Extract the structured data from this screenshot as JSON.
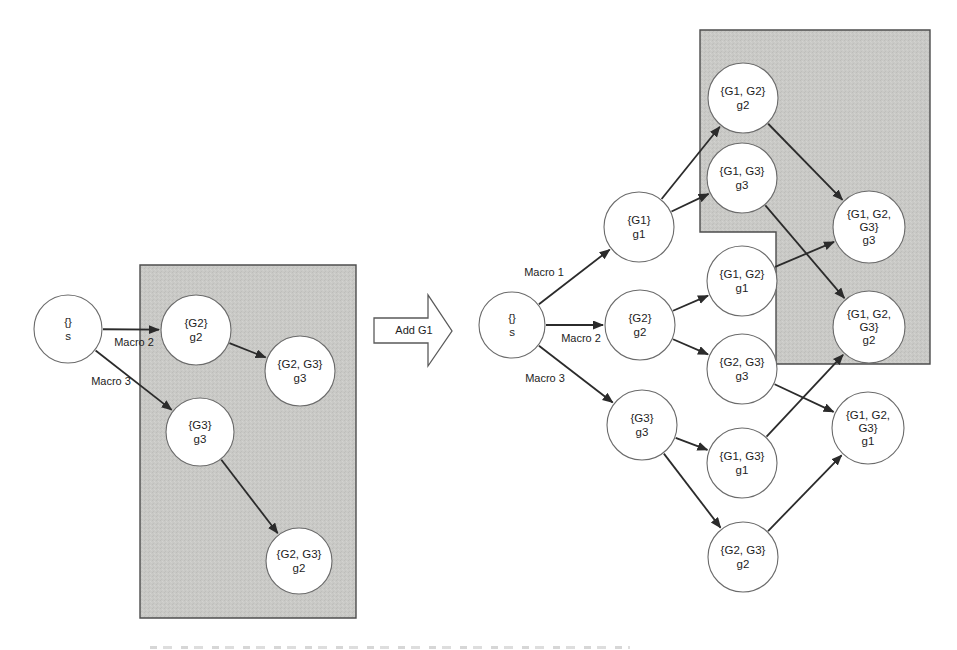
{
  "figure": {
    "background": "#ffffff",
    "region_fill": "#c9c9c6",
    "region_fill_dark_speck": "#bdbdba",
    "region_fill_light_speck": "#d3d3d0",
    "region_stroke": "#4d4d4d",
    "edge_color": "#2b2b2b",
    "node_fill": "#ffffff",
    "node_stroke": "#6b6b6b",
    "text_color": "#1d1d1d"
  },
  "transition_arrow": {
    "label": "Add G1",
    "points": "374,318 428,318 428,295 452,331 428,366 428,343 374,343",
    "label_x": 414,
    "label_y": 334
  },
  "left_graph": {
    "regions": [
      {
        "name": "macro-subset-region",
        "points": "140,265 356,265 356,618 140,618"
      }
    ],
    "nodes": [
      {
        "id": "s",
        "x": 68,
        "y": 329,
        "r": 34,
        "lines": [
          "{}",
          "s"
        ]
      },
      {
        "id": "g2",
        "x": 196,
        "y": 330,
        "r": 35,
        "lines": [
          "{G2}",
          "g2"
        ]
      },
      {
        "id": "g23-g3",
        "x": 300,
        "y": 371,
        "r": 35,
        "lines": [
          "{G2, G3}",
          "g3"
        ]
      },
      {
        "id": "g3",
        "x": 200,
        "y": 432,
        "r": 34,
        "lines": [
          "{G3}",
          "g3"
        ]
      },
      {
        "id": "g23-g2",
        "x": 299,
        "y": 561,
        "r": 33,
        "lines": [
          "{G2, G3}",
          "g2"
        ]
      }
    ],
    "edges": [
      {
        "from": "s",
        "to": "g2",
        "label": "Macro 2",
        "lx": 134,
        "ly": 346
      },
      {
        "from": "s",
        "to": "g3",
        "label": "Macro 3",
        "lx": 111,
        "ly": 385
      },
      {
        "from": "g2",
        "to": "g23-g3",
        "label": "",
        "lx": 0,
        "ly": 0
      },
      {
        "from": "g3",
        "to": "g23-g2",
        "label": "",
        "lx": 0,
        "ly": 0
      }
    ]
  },
  "right_graph": {
    "regions": [
      {
        "name": "macro-subset-region",
        "points": "700,30 930,30 930,364 776,364 776,232 700,232"
      }
    ],
    "nodes": [
      {
        "id": "s",
        "x": 512,
        "y": 325,
        "r": 33,
        "lines": [
          "{}",
          "s"
        ]
      },
      {
        "id": "g1",
        "x": 639,
        "y": 227,
        "r": 35,
        "lines": [
          "{G1}",
          "g1"
        ]
      },
      {
        "id": "g2",
        "x": 640,
        "y": 325,
        "r": 35,
        "lines": [
          "{G2}",
          "g2"
        ]
      },
      {
        "id": "g3",
        "x": 642,
        "y": 425,
        "r": 35,
        "lines": [
          "{G3}",
          "g3"
        ]
      },
      {
        "id": "g12-g2",
        "x": 743,
        "y": 98,
        "r": 35,
        "lines": [
          "{G1, G2}",
          "g2"
        ]
      },
      {
        "id": "g13-g3",
        "x": 742,
        "y": 178,
        "r": 35,
        "lines": [
          "{G1, G3}",
          "g3"
        ]
      },
      {
        "id": "g12-g1",
        "x": 742,
        "y": 281,
        "r": 35,
        "lines": [
          "{G1, G2}",
          "g1"
        ]
      },
      {
        "id": "g23-g3",
        "x": 742,
        "y": 369,
        "r": 35,
        "lines": [
          "{G2, G3}",
          "g3"
        ]
      },
      {
        "id": "g13-g1",
        "x": 742,
        "y": 463,
        "r": 35,
        "lines": [
          "{G1, G3}",
          "g1"
        ]
      },
      {
        "id": "g23-g2",
        "x": 743,
        "y": 557,
        "r": 35,
        "lines": [
          "{G2, G3}",
          "g2"
        ]
      },
      {
        "id": "g123-g3",
        "x": 869,
        "y": 227,
        "r": 36,
        "lines": [
          "{G1, G2,",
          "G3}",
          "g3"
        ]
      },
      {
        "id": "g123-g2",
        "x": 869,
        "y": 327,
        "r": 36,
        "lines": [
          "{G1, G2,",
          "G3}",
          "g2"
        ]
      },
      {
        "id": "g123-g1",
        "x": 868,
        "y": 428,
        "r": 36,
        "lines": [
          "{G1, G2,",
          "G3}",
          "g1"
        ]
      }
    ],
    "edges": [
      {
        "from": "s",
        "to": "g1",
        "label": "Macro 1",
        "lx": 544,
        "ly": 276
      },
      {
        "from": "s",
        "to": "g2",
        "label": "Macro 2",
        "lx": 581,
        "ly": 342
      },
      {
        "from": "s",
        "to": "g3",
        "label": "Macro 3",
        "lx": 545,
        "ly": 382
      },
      {
        "from": "g1",
        "to": "g12-g2",
        "label": "",
        "lx": 0,
        "ly": 0
      },
      {
        "from": "g1",
        "to": "g13-g3",
        "label": "",
        "lx": 0,
        "ly": 0
      },
      {
        "from": "g2",
        "to": "g12-g1",
        "label": "",
        "lx": 0,
        "ly": 0
      },
      {
        "from": "g2",
        "to": "g23-g3",
        "label": "",
        "lx": 0,
        "ly": 0
      },
      {
        "from": "g3",
        "to": "g13-g1",
        "label": "",
        "lx": 0,
        "ly": 0
      },
      {
        "from": "g3",
        "to": "g23-g2",
        "label": "",
        "lx": 0,
        "ly": 0
      },
      {
        "from": "g12-g2",
        "to": "g123-g3",
        "label": "",
        "lx": 0,
        "ly": 0
      },
      {
        "from": "g12-g1",
        "to": "g123-g3",
        "label": "",
        "lx": 0,
        "ly": 0
      },
      {
        "from": "g13-g3",
        "to": "g123-g2",
        "label": "",
        "lx": 0,
        "ly": 0
      },
      {
        "from": "g13-g1",
        "to": "g123-g2",
        "label": "",
        "lx": 0,
        "ly": 0
      },
      {
        "from": "g23-g3",
        "to": "g123-g1",
        "label": "",
        "lx": 0,
        "ly": 0
      },
      {
        "from": "g23-g2",
        "to": "g123-g1",
        "label": "",
        "lx": 0,
        "ly": 0
      }
    ]
  }
}
